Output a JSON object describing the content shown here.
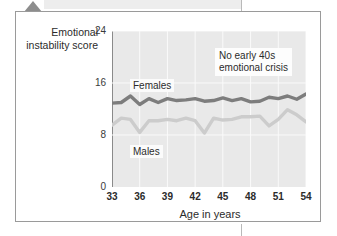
{
  "figure": {
    "y_axis_title": "Emotional instability score",
    "annotation": "No early 40s emotional crisis",
    "annotation_line1": "No early 40s",
    "annotation_line2": "emotional crisis",
    "series_labels": {
      "females": "Females",
      "males": "Males"
    },
    "colors": {
      "females_line": "#7d7d7d",
      "males_line": "#cccccc",
      "plot_background": "#e9e9e9",
      "gridline": "#fafafa",
      "frame_border": "#9a9a9a",
      "axis": "#8a8a8a",
      "pointer": "#8d8d8d"
    }
  },
  "chart_data": {
    "type": "line",
    "title": "",
    "subtitle": "",
    "xlabel": "Age in years",
    "ylabel": "Emotional instability score",
    "xlim": [
      33,
      54
    ],
    "ylim": [
      0,
      24
    ],
    "yticks": [
      0,
      8,
      16,
      24
    ],
    "xticks": [
      33,
      36,
      39,
      42,
      45,
      48,
      51,
      54
    ],
    "grid": true,
    "legend_position": "in-plot labels",
    "annotations": [
      {
        "text": "No early 40s emotional crisis",
        "x": 48,
        "y": 20
      }
    ],
    "x": [
      33,
      34,
      35,
      36,
      37,
      38,
      39,
      40,
      41,
      42,
      43,
      44,
      45,
      46,
      47,
      48,
      49,
      50,
      51,
      52,
      53,
      54
    ],
    "series": [
      {
        "name": "Females",
        "color": "#7d7d7d",
        "values": [
          12.9,
          13.0,
          14.0,
          12.7,
          13.6,
          13.0,
          13.6,
          13.3,
          13.4,
          13.6,
          13.2,
          13.3,
          13.7,
          13.3,
          13.6,
          13.1,
          13.2,
          13.8,
          13.6,
          14.0,
          13.5,
          14.3
        ]
      },
      {
        "name": "Males",
        "color": "#cccccc",
        "values": [
          9.5,
          10.6,
          10.4,
          8.4,
          10.2,
          10.2,
          10.4,
          10.2,
          10.6,
          10.2,
          8.3,
          10.6,
          10.3,
          10.4,
          10.8,
          10.8,
          10.9,
          9.4,
          10.4,
          11.9,
          11.1,
          10.0
        ]
      }
    ]
  }
}
